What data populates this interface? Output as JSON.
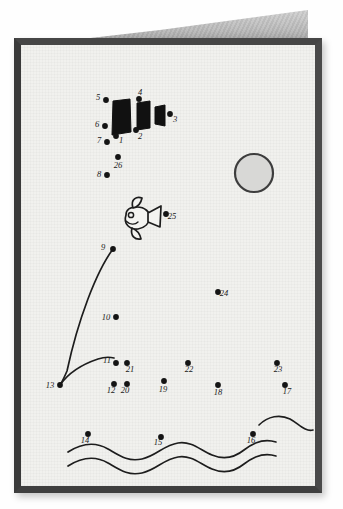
{
  "scene": {
    "title": "Connect-the-dots greeting card",
    "description": "Hand-drawn connect-the-dots puzzle on a folded greeting card showing a fish, a sun, ocean waves and a partially inked sailboat",
    "paper_color": "#f1f1ee",
    "border_color": "#3b3b3b",
    "ink_color": "#1d1d1d",
    "back_page_color": "#b9b9b9"
  },
  "sun": {
    "label": "sun",
    "cx": 254,
    "cy": 173,
    "r": 19,
    "fill": "#d8d8d6",
    "stroke": "#3d3d3d"
  },
  "fish": {
    "label": "fish",
    "cx": 139,
    "cy": 218,
    "eye_cx": 131,
    "eye_cy": 215
  },
  "black_shapes": [
    {
      "name": "sail-block-1",
      "points": "113,101 130,99 131,132 112,135"
    },
    {
      "name": "sail-block-2",
      "points": "137,103 150,101 150,128 137,130"
    },
    {
      "name": "sail-block-3",
      "points": "155,107 165,105 165,126 155,124"
    }
  ],
  "dots": [
    {
      "n": "1",
      "x": 116,
      "y": 136,
      "lx": 121,
      "ly": 143
    },
    {
      "n": "2",
      "x": 136,
      "y": 130,
      "lx": 140,
      "ly": 139
    },
    {
      "n": "3",
      "x": 170,
      "y": 114,
      "lx": 175,
      "ly": 122
    },
    {
      "n": "4",
      "x": 139,
      "y": 99,
      "lx": 140,
      "ly": 95
    },
    {
      "n": "5",
      "x": 106,
      "y": 100,
      "lx": 98,
      "ly": 100
    },
    {
      "n": "6",
      "x": 105,
      "y": 126,
      "lx": 97,
      "ly": 127
    },
    {
      "n": "7",
      "x": 107,
      "y": 142,
      "lx": 99,
      "ly": 143
    },
    {
      "n": "8",
      "x": 107,
      "y": 175,
      "lx": 99,
      "ly": 177
    },
    {
      "n": "9",
      "x": 113,
      "y": 249,
      "lx": 103,
      "ly": 250
    },
    {
      "n": "10",
      "x": 116,
      "y": 317,
      "lx": 106,
      "ly": 320
    },
    {
      "n": "11",
      "x": 116,
      "y": 363,
      "lx": 107,
      "ly": 363
    },
    {
      "n": "12",
      "x": 114,
      "y": 384,
      "lx": 111,
      "ly": 393
    },
    {
      "n": "13",
      "x": 60,
      "y": 385,
      "lx": 50,
      "ly": 388
    },
    {
      "n": "14",
      "x": 88,
      "y": 434,
      "lx": 85,
      "ly": 443
    },
    {
      "n": "15",
      "x": 161,
      "y": 437,
      "lx": 158,
      "ly": 445
    },
    {
      "n": "16",
      "x": 253,
      "y": 434,
      "lx": 251,
      "ly": 443
    },
    {
      "n": "17",
      "x": 285,
      "y": 385,
      "lx": 287,
      "ly": 394
    },
    {
      "n": "18",
      "x": 218,
      "y": 385,
      "lx": 218,
      "ly": 395
    },
    {
      "n": "19",
      "x": 164,
      "y": 381,
      "lx": 163,
      "ly": 392
    },
    {
      "n": "20",
      "x": 127,
      "y": 384,
      "lx": 125,
      "ly": 393
    },
    {
      "n": "21",
      "x": 127,
      "y": 363,
      "lx": 130,
      "ly": 372
    },
    {
      "n": "22",
      "x": 188,
      "y": 363,
      "lx": 189,
      "ly": 372
    },
    {
      "n": "23",
      "x": 277,
      "y": 363,
      "lx": 278,
      "ly": 372
    },
    {
      "n": "24",
      "x": 218,
      "y": 292,
      "lx": 224,
      "ly": 296
    },
    {
      "n": "25",
      "x": 166,
      "y": 214,
      "lx": 172,
      "ly": 219
    },
    {
      "n": "26",
      "x": 118,
      "y": 157,
      "lx": 118,
      "ly": 168
    }
  ],
  "lines": [
    {
      "name": "fishing-line",
      "d": "M113,249 C 96,272 78,320 67,371 C 64,378 62,382 60,385"
    },
    {
      "name": "hull-curve",
      "d": "M60,385 C 67,375 80,365 98,359 C 104,357 110,357 114,358"
    }
  ],
  "waves": [
    {
      "name": "wave-top-right",
      "d": "M259,425 C 268,416 280,414 290,419 C 299,424 305,432 313,430"
    },
    {
      "name": "wave-middle",
      "d": "M68,452 C 82,443 96,442 108,449 C 120,456 128,462 142,459 C 156,456 164,445 178,443 C 192,441 200,450 212,455 C 224,460 234,458 244,450 C 254,442 264,438 276,442"
    },
    {
      "name": "wave-bottom",
      "d": "M68,466 C 82,457 96,456 108,463 C 120,470 128,476 142,473 C 156,470 164,459 178,457 C 192,455 200,464 212,469 C 224,474 234,472 244,464 C 254,456 264,452 276,456"
    }
  ]
}
